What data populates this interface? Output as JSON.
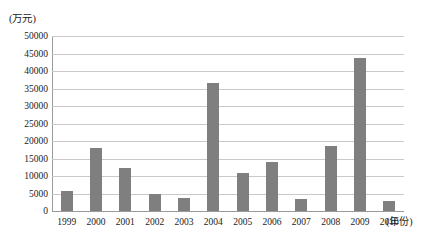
{
  "chart_data": {
    "type": "bar",
    "title": "",
    "subtitle": "",
    "xlabel": "(年份)",
    "ylabel": "(万元)",
    "ylim": [
      0,
      50000
    ],
    "ytick_step": 5000,
    "grid": true,
    "legend": false,
    "bar_color": "#7f7f7f",
    "gridline_color": "#c9c9c9",
    "axis_color": "#9a9a9a",
    "categories": [
      "1999",
      "2000",
      "2001",
      "2002",
      "2003",
      "2004",
      "2005",
      "2006",
      "2007",
      "2008",
      "2009",
      "2010"
    ],
    "values": [
      5800,
      18000,
      12300,
      4800,
      3800,
      36700,
      10800,
      14000,
      3500,
      18700,
      43800,
      2800
    ],
    "ytick_labels": [
      "50000",
      "45000",
      "40000",
      "35000",
      "30000",
      "25000",
      "20000",
      "15000",
      "10000",
      "5000",
      "0"
    ],
    "ytick_values": [
      50000,
      45000,
      40000,
      35000,
      30000,
      25000,
      20000,
      15000,
      10000,
      5000,
      0
    ]
  }
}
